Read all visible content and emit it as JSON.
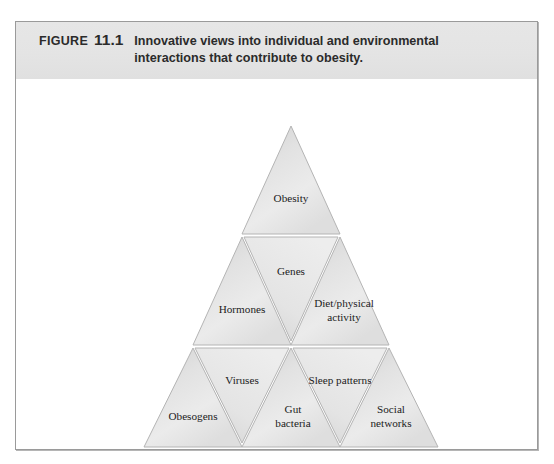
{
  "figure": {
    "label_word": "FIGURE",
    "number": "11.1",
    "caption": "Innovative views into individual and environmental interactions that contribute to obesity."
  },
  "colors": {
    "caption_band": "#e4e4e4",
    "frame_border": "#9a9a9a",
    "triangle_fill_light": "#f2f2f2",
    "triangle_fill_dark": "#c9c9c9",
    "triangle_stroke": "#b0b0b0",
    "label_text": "#1c1c1c",
    "page_background": "#ffffff"
  },
  "diagram": {
    "type": "nested-triangle",
    "orientation": "apex-up",
    "rows": 3,
    "apex": {
      "x": 290,
      "y": 104
    },
    "base_left": {
      "x": 143,
      "y": 425
    },
    "base_right": {
      "x": 437,
      "y": 425
    },
    "cells": [
      {
        "row": 1,
        "index": 0,
        "direction": "up",
        "label": "Obesity"
      },
      {
        "row": 2,
        "index": 0,
        "direction": "up",
        "label": "Hormones"
      },
      {
        "row": 2,
        "index": 1,
        "direction": "down",
        "label": "Genes"
      },
      {
        "row": 2,
        "index": 2,
        "direction": "up",
        "label": "Diet/physical activity"
      },
      {
        "row": 3,
        "index": 0,
        "direction": "up",
        "label": "Obesogens"
      },
      {
        "row": 3,
        "index": 1,
        "direction": "down",
        "label": "Viruses"
      },
      {
        "row": 3,
        "index": 2,
        "direction": "up",
        "label": "Gut bacteria"
      },
      {
        "row": 3,
        "index": 3,
        "direction": "down",
        "label": "Sleep patterns"
      },
      {
        "row": 3,
        "index": 4,
        "direction": "up",
        "label": "Social networks"
      }
    ],
    "labels": {
      "obesity": "Obesity",
      "hormones": "Hormones",
      "genes": "Genes",
      "diet_line1": "Diet/physical",
      "diet_line2": "activity",
      "obesogens": "Obesogens",
      "viruses": "Viruses",
      "gut_line1": "Gut",
      "gut_line2": "bacteria",
      "sleep": "Sleep patterns",
      "social_line1": "Social",
      "social_line2": "networks"
    }
  }
}
